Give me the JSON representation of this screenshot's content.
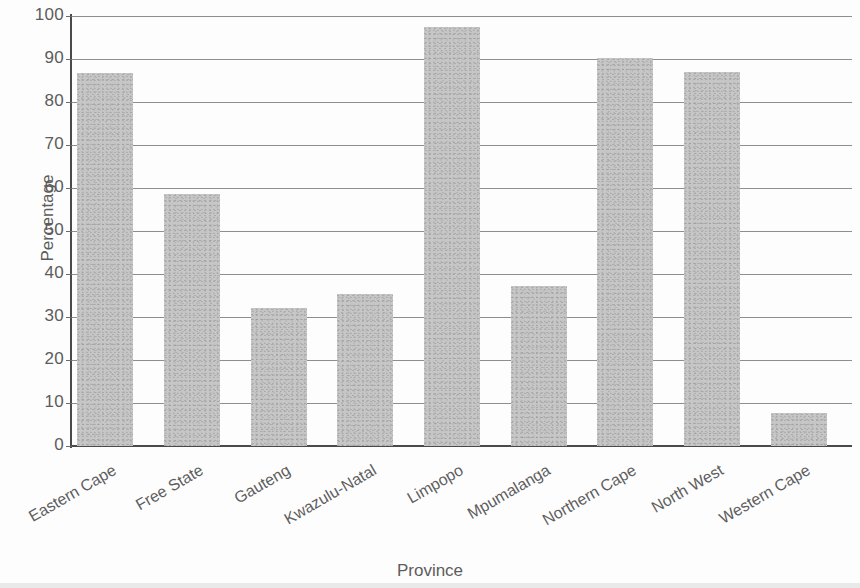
{
  "chart_data": {
    "type": "bar",
    "title": "",
    "xlabel": "Province",
    "ylabel": "Percentage",
    "categories": [
      "Eastern Cape",
      "Free State",
      "Gauteng",
      "Kwazulu-Natal",
      "Limpopo",
      "Mpumalanga",
      "Northern Cape",
      "North West",
      "Western Cape"
    ],
    "values": [
      86.7,
      58.5,
      32.0,
      35.3,
      97.5,
      37.2,
      90.3,
      87.0,
      7.7
    ],
    "ylim": [
      0,
      100
    ],
    "ytick_labels": [
      "100",
      "90",
      "80",
      "70",
      "60",
      "50",
      "40",
      "30",
      "20",
      "10",
      "0"
    ],
    "ytick_values": [
      100,
      90,
      80,
      70,
      60,
      50,
      40,
      30,
      20,
      10,
      0
    ],
    "grid": true,
    "legend": false,
    "bar_color": "#c6c6c6",
    "axis_color": "#4a4a4a",
    "grid_color": "#8e8e8e",
    "text_color": "#5c5c5c",
    "background": "#fdfdfd"
  }
}
